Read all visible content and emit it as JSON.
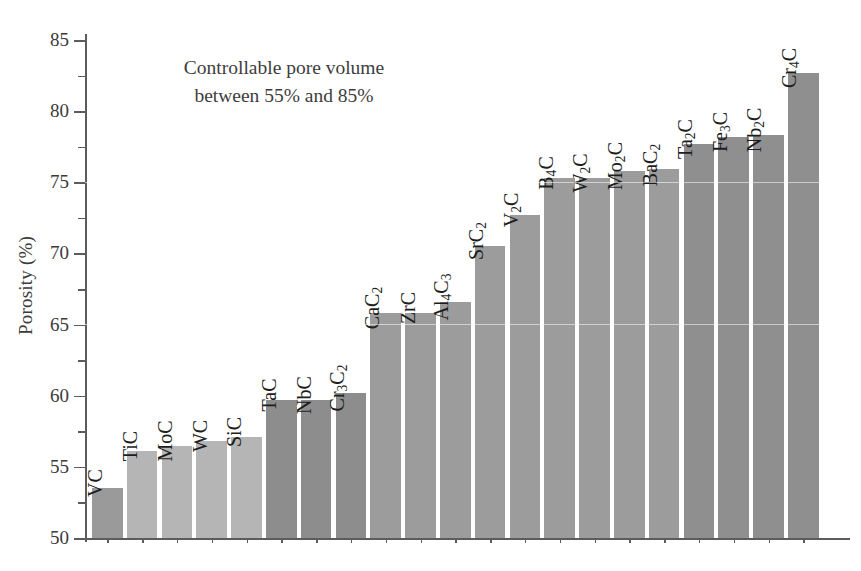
{
  "chart_data": {
    "type": "bar",
    "title": "",
    "xlabel": "",
    "ylabel": "Porosity (%)",
    "ylim": [
      50,
      85
    ],
    "ytick_major": [
      50,
      55,
      60,
      65,
      70,
      75,
      80,
      85
    ],
    "ytick_minor": [
      52.5,
      57.5,
      62.5,
      67.5,
      72.5,
      77.5,
      82.5
    ],
    "grid": false,
    "legend": null,
    "annotations": [
      {
        "text_line_1": "Controllable pore volume",
        "text_line_2": "between 55% and 85%",
        "x_frac": 0.12,
        "y_value": 81.5
      }
    ],
    "categories": [
      "VC",
      "TiC",
      "MoC",
      "WC",
      "SiC",
      "TaC",
      "NbC",
      "Cr3C2",
      "CaC2",
      "ZrC",
      "Al4C3",
      "SrC2",
      "V2C",
      "B4C",
      "W2C",
      "Mo2C",
      "BaC2",
      "Ta2C",
      "Fe3C",
      "Nb2C",
      "Cr4C"
    ],
    "category_labels_html": [
      "VC",
      "TiC",
      "MoC",
      "WC",
      "SiC",
      "TaC",
      "NbC",
      "Cr<sub>3</sub>C<sub>2</sub>",
      "CaC<sub>2</sub>",
      "ZrC",
      "Al<sub>4</sub>C<sub>3</sub>",
      "SrC<sub>2</sub>",
      "V<sub>2</sub>C",
      "B<sub>4</sub>C",
      "W<sub>2</sub>C",
      "Mo<sub>2</sub>C",
      "BaC<sub>2</sub>",
      "Ta<sub>2</sub>C",
      "Fe<sub>3</sub>C",
      "Nb<sub>2</sub>C",
      "Cr<sub>4</sub>C"
    ],
    "values": [
      53.5,
      56.1,
      56.5,
      56.8,
      57.1,
      59.7,
      59.7,
      60.2,
      65.8,
      65.8,
      66.6,
      70.5,
      72.7,
      75.3,
      75.3,
      75.8,
      75.9,
      77.7,
      78.2,
      78.3,
      82.7
    ],
    "bar_colors": [
      "#9a9a9a",
      "#b5b5b5",
      "#b5b5b5",
      "#b5b5b5",
      "#b5b5b5",
      "#8d8d8d",
      "#8d8d8d",
      "#8d8d8d",
      "#9c9c9c",
      "#9c9c9c",
      "#9c9c9c",
      "#9c9c9c",
      "#9c9c9c",
      "#9c9c9c",
      "#9c9c9c",
      "#9c9c9c",
      "#9c9c9c",
      "#8f8f8f",
      "#8f8f8f",
      "#8f8f8f",
      "#8f8f8f"
    ],
    "axis_color": "#5c5c5c",
    "text_color": "#3b3b3b"
  }
}
